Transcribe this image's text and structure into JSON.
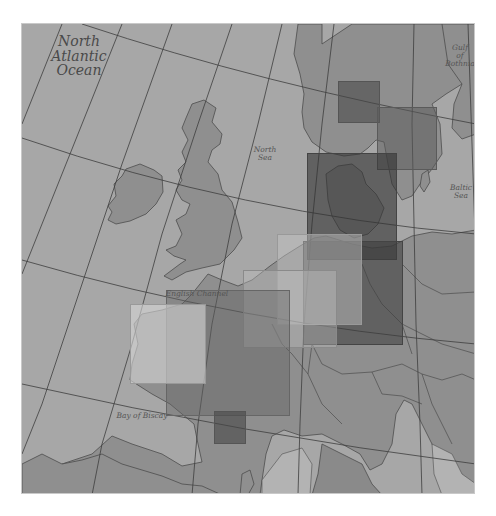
{
  "map": {
    "colors": {
      "sea": "#a7a7a7",
      "land": "#8f8f8f",
      "border": "#555555",
      "graticule": "#3e3e3e",
      "coverage_dark": "#5a5a5a",
      "coverage_medium": "#7a7a7a",
      "coverage_light": "#c4c4c4"
    },
    "labels": {
      "north_atlantic": "North\nAtlantic\nOcean",
      "north_atlantic_l1": "North",
      "north_atlantic_l2": "Atlantic",
      "north_atlantic_l3": "Ocean",
      "north_sea_l1": "North",
      "north_sea_l2": "Sea",
      "gulf_l1": "Gulf",
      "gulf_l2": "of",
      "gulf_l3": "Bothnia",
      "baltic_l1": "Baltic",
      "baltic_l2": "Sea",
      "english_channel": "English Channel",
      "bay_of_biscay": "Bay of Biscay"
    },
    "coverage_areas": [
      {
        "name": "norway-south",
        "tone": "dark"
      },
      {
        "name": "sweden-south",
        "tone": "medium"
      },
      {
        "name": "denmark",
        "tone": "dark"
      },
      {
        "name": "germany",
        "tone": "dark"
      },
      {
        "name": "netherlands-west-germany",
        "tone": "light"
      },
      {
        "name": "belgium-north-france",
        "tone": "light"
      },
      {
        "name": "france",
        "tone": "medium"
      },
      {
        "name": "brittany",
        "tone": "light"
      },
      {
        "name": "southwest-france",
        "tone": "dark"
      }
    ]
  }
}
